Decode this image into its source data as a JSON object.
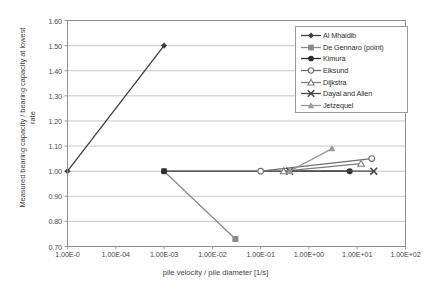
{
  "chart_data": {
    "type": "scatter",
    "title": "",
    "xlabel": "pile velocity / pile diameter [1/s]",
    "ylabel": "Measured bearing capacity / bearing capacity at lowest rate",
    "xscale": "log",
    "xlim": [
      1e-05,
      100.0
    ],
    "ylim": [
      0.7,
      1.6
    ],
    "grid": "horizontal",
    "legend_position": "top-right",
    "xticks": [
      "1.00E-0",
      "1.00E-04",
      "1.00E-03",
      "1.00E-02",
      "1.00E-01",
      "1.00E+00",
      "1.00E+01",
      "1.00E+02"
    ],
    "xtick_values": [
      1e-05,
      0.0001,
      0.001,
      0.01,
      0.1,
      1,
      10,
      100
    ],
    "yticks": [
      "0.70",
      "0.80",
      "0.90",
      "1.00",
      "1.10",
      "1.20",
      "1.30",
      "1.40",
      "1.50",
      "1.60"
    ],
    "ytick_values": [
      0.7,
      0.8,
      0.9,
      1.0,
      1.1,
      1.2,
      1.3,
      1.4,
      1.5,
      1.6
    ],
    "series": [
      {
        "name": "Al Mhaidib",
        "marker": "diamond",
        "color": "#3f3f3f",
        "x": [
          1e-05,
          0.001
        ],
        "y": [
          1.0,
          1.5
        ]
      },
      {
        "name": "De Gennaro (point)",
        "marker": "square",
        "color": "#8a8a8a",
        "x": [
          0.001,
          0.03
        ],
        "y": [
          1.0,
          0.73
        ]
      },
      {
        "name": "Kimura",
        "marker": "circle-filled",
        "color": "#2e2e2e",
        "x": [
          0.001,
          7.0
        ],
        "y": [
          1.0,
          1.0
        ]
      },
      {
        "name": "Eiksund",
        "marker": "circle-open",
        "color": "#6f6f6f",
        "x": [
          0.1,
          20.0
        ],
        "y": [
          1.0,
          1.05
        ]
      },
      {
        "name": "Dijkstra",
        "marker": "triangle-open",
        "color": "#7d7d7d",
        "x": [
          0.3,
          12.0
        ],
        "y": [
          1.0,
          1.03
        ]
      },
      {
        "name": "Dayal and Allen",
        "marker": "cross",
        "color": "#4a4a4a",
        "x": [
          0.4,
          22.0
        ],
        "y": [
          1.0,
          1.0
        ]
      },
      {
        "name": "Jetzequel",
        "marker": "triangle-filled",
        "color": "#9a9a9a",
        "x": [
          0.4,
          3.0
        ],
        "y": [
          1.0,
          1.09
        ]
      }
    ]
  },
  "legend": {
    "entries": [
      {
        "label": "Al Mhaidib"
      },
      {
        "label": "De Gennaro (point)"
      },
      {
        "label": "Kimura"
      },
      {
        "label": "Eiksund"
      },
      {
        "label": "Dijkstra"
      },
      {
        "label": "Dayal and Allen"
      },
      {
        "label": "Jetzequel"
      }
    ]
  },
  "axes": {
    "x_title": "pile velocity / pile diameter [1/s]",
    "y_title": "Measured bearing capacity / bearing capacity at lowest rate"
  }
}
